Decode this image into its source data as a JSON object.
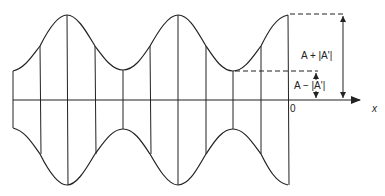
{
  "diagram": {
    "type": "amplitude-modulated standing wave envelope",
    "axis": {
      "origin_label": "0",
      "x_label": "x"
    },
    "annotations": {
      "max_label": "A + |A'|",
      "min_label": "A − |A'|"
    },
    "colors": {
      "stroke": "#222222",
      "background": "#ffffff"
    },
    "geometry": {
      "axis_y": 100,
      "envelope_max_half_height": 85,
      "envelope_min_half_height": 29,
      "peaks_x": [
        67,
        178,
        288
      ],
      "troughs_x": [
        123,
        233
      ],
      "vertical_lines_x": [
        13,
        40,
        67,
        95,
        123,
        150,
        178,
        206,
        233,
        261,
        288
      ]
    }
  }
}
